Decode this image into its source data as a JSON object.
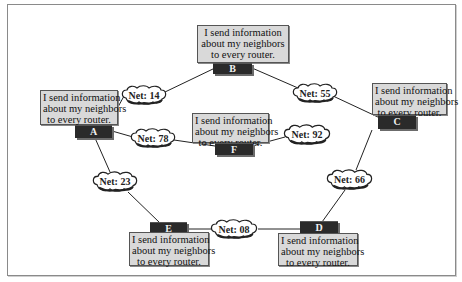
{
  "diagram": {
    "routers": [
      {
        "id": "A",
        "label": "A",
        "message": [
          "I send information",
          "about my neighbors",
          "to every router."
        ]
      },
      {
        "id": "B",
        "label": "B",
        "message": [
          "I send information",
          "about my neighbors",
          "to every router."
        ]
      },
      {
        "id": "C",
        "label": "C",
        "message": [
          "I send information",
          "about my neighbors",
          "to every router."
        ]
      },
      {
        "id": "D",
        "label": "D",
        "message": [
          "I send information",
          "about my neighbors",
          "to every router."
        ]
      },
      {
        "id": "E",
        "label": "E",
        "message": [
          "I send information",
          "about my neighbors",
          "to every router."
        ]
      },
      {
        "id": "F",
        "label": "F",
        "message": [
          "I send information",
          "about my neighbors",
          "to every router."
        ]
      }
    ],
    "networks": [
      {
        "label": "Net: 14",
        "connects": [
          "A",
          "B"
        ]
      },
      {
        "label": "Net: 55",
        "connects": [
          "B",
          "C"
        ]
      },
      {
        "label": "Net: 78",
        "connects": [
          "A",
          "F"
        ]
      },
      {
        "label": "Net: 92",
        "connects": [
          "F",
          "C"
        ]
      },
      {
        "label": "Net: 23",
        "connects": [
          "A",
          "E"
        ]
      },
      {
        "label": "Net: 66",
        "connects": [
          "C",
          "D"
        ]
      },
      {
        "label": "Net: 08",
        "connects": [
          "E",
          "D"
        ]
      }
    ]
  },
  "colors": {
    "router_fill": "#2a2a2a",
    "message_fill": "#d9d9d9",
    "link": "#222222",
    "frame": "#8a8a8a"
  }
}
